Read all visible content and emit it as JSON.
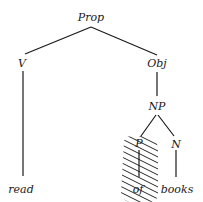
{
  "diagram": {
    "type": "syntax-tree",
    "nodes": {
      "root": {
        "label": "Prop"
      },
      "v": {
        "label": "V"
      },
      "obj": {
        "label": "Obj"
      },
      "np": {
        "label": "NP"
      },
      "p": {
        "label": "P"
      },
      "n": {
        "label": "N"
      },
      "leaf_read": {
        "label": "read"
      },
      "leaf_of": {
        "label": "of"
      },
      "leaf_books": {
        "label": "books"
      }
    },
    "edges": [
      [
        "Prop",
        "V"
      ],
      [
        "Prop",
        "Obj"
      ],
      [
        "V",
        "read"
      ],
      [
        "Obj",
        "NP"
      ],
      [
        "NP",
        "P"
      ],
      [
        "NP",
        "N"
      ],
      [
        "P",
        "of"
      ],
      [
        "N",
        "books"
      ]
    ],
    "highlighted_subtree": {
      "node": "P",
      "leaf": "of",
      "style": "diagonal-hatch"
    }
  }
}
